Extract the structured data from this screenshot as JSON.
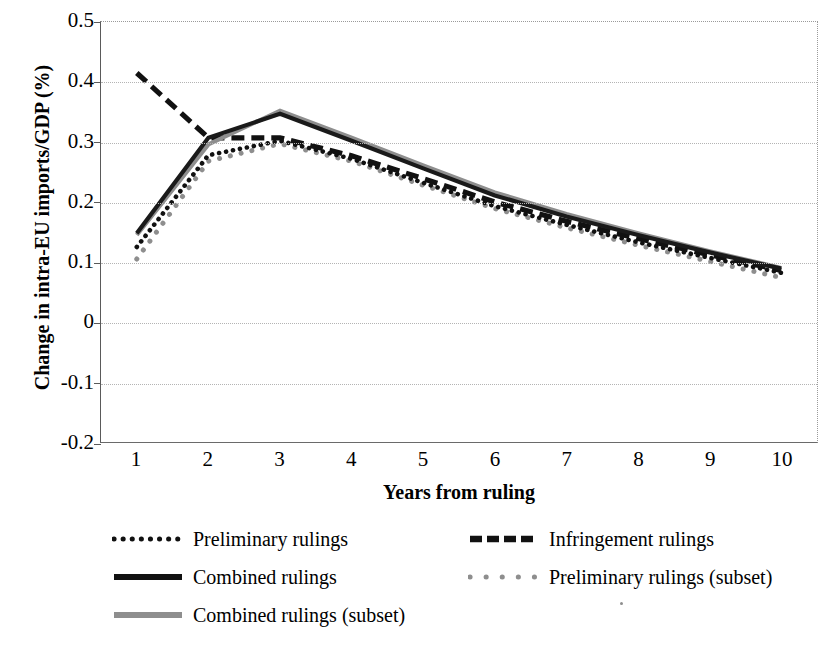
{
  "chart_data": {
    "type": "line",
    "title": "",
    "xlabel": "Years from ruling",
    "ylabel": "Change in intra-EU imports/GDP (%)",
    "x": [
      1,
      2,
      3,
      4,
      5,
      6,
      7,
      8,
      9,
      10
    ],
    "xtick_labels": [
      "1",
      "2",
      "3",
      "4",
      "5",
      "6",
      "7",
      "8",
      "9",
      "10"
    ],
    "ytick_labels": [
      "0.5",
      "0.4",
      "0.3",
      "0.2",
      "0.1",
      "0",
      "-0.1",
      "-0.2"
    ],
    "ytick_values": [
      0.5,
      0.4,
      0.3,
      0.2,
      0.1,
      0,
      -0.1,
      -0.2
    ],
    "ylim": [
      -0.2,
      0.5
    ],
    "xlim": [
      0.5,
      10.5
    ],
    "grid": "horizontal",
    "legend_position": "below-plot",
    "series": [
      {
        "name": "Preliminary rulings",
        "style": "dotted",
        "color": "#111111",
        "values": [
          0.125,
          0.278,
          0.302,
          0.272,
          0.232,
          0.193,
          0.162,
          0.133,
          0.107,
          0.082
        ]
      },
      {
        "name": "Infringement rulings",
        "style": "dashed",
        "color": "#111111",
        "values": [
          0.415,
          0.307,
          0.307,
          0.277,
          0.239,
          0.2,
          0.168,
          0.139,
          0.112,
          0.086
        ]
      },
      {
        "name": "Combined rulings",
        "style": "solid",
        "color": "#1a1a1a",
        "values": [
          0.148,
          0.307,
          0.347,
          0.302,
          0.256,
          0.211,
          0.176,
          0.145,
          0.116,
          0.089
        ]
      },
      {
        "name": "Preliminary rulings (subset)",
        "style": "dotted-sparse",
        "color": "#8e8e8e",
        "values": [
          0.105,
          0.268,
          0.297,
          0.268,
          0.228,
          0.189,
          0.157,
          0.128,
          0.101,
          0.074
        ]
      },
      {
        "name": "Combined rulings (subset)",
        "style": "solid",
        "color": "#8e8e8e",
        "values": [
          0.145,
          0.296,
          0.352,
          0.307,
          0.261,
          0.216,
          0.18,
          0.148,
          0.118,
          0.09
        ]
      }
    ]
  },
  "legend": {
    "items": [
      {
        "label": "Preliminary rulings",
        "marker": "dotted-line-marker"
      },
      {
        "label": "Infringement rulings",
        "marker": "dashed-line-marker"
      },
      {
        "label": "Combined rulings",
        "marker": "solid-black-line-marker"
      },
      {
        "label": "Preliminary rulings (subset)",
        "marker": "sparse-gray-dots-marker"
      },
      {
        "label": "Combined rulings (subset)",
        "marker": "solid-gray-line-marker"
      }
    ]
  }
}
